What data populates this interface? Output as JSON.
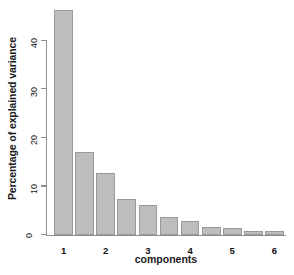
{
  "chart_data": {
    "type": "bar",
    "title": "",
    "subtitle": "",
    "xlabel": "components",
    "ylabel": "Percentage of explained variance",
    "categories": [
      "1",
      "2",
      "3",
      "4",
      "5",
      "6",
      "7",
      "8",
      "9",
      "10",
      "11"
    ],
    "values": [
      46.3,
      16.9,
      12.6,
      7.4,
      6.0,
      3.7,
      2.7,
      1.5,
      1.4,
      0.8,
      0.8
    ],
    "series": [
      {
        "name": "Percentage of explained variance",
        "values": [
          46.3,
          16.9,
          12.6,
          7.4,
          6.0,
          3.7,
          2.7,
          1.5,
          1.4,
          0.8,
          0.8
        ]
      }
    ],
    "ylim": [
      0,
      48
    ],
    "xlim": [
      0,
      11
    ],
    "yticks": [
      "0",
      "10",
      "20",
      "30",
      "40"
    ],
    "ytick_values": [
      0,
      10,
      20,
      30,
      40
    ],
    "grid": false,
    "legend": false,
    "legend_position": "none",
    "bar_fill_color": "#bdbdbd",
    "bar_border_color": "#9a9a9a",
    "axis_color": "#8f8f8f",
    "text_color": "#1a1a1a",
    "background_color": "#ffffff"
  }
}
